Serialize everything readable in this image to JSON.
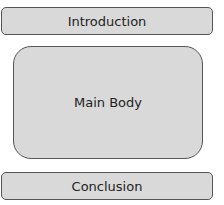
{
  "diagram": {
    "sections": [
      {
        "label": "Introduction"
      },
      {
        "label": "Main Body"
      },
      {
        "label": "Conclusion"
      }
    ],
    "colors": {
      "fill": "#d9d9d9",
      "border": "#555555",
      "text": "#222222"
    }
  }
}
